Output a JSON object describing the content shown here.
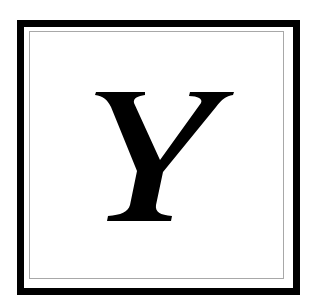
{
  "card": {
    "letter": "Y",
    "style": "bold italic serif",
    "frame": {
      "outer_border_color": "#000000",
      "inner_rule_color": "#a8a8a8",
      "background": "#ffffff"
    },
    "letter_color": "#000000"
  }
}
